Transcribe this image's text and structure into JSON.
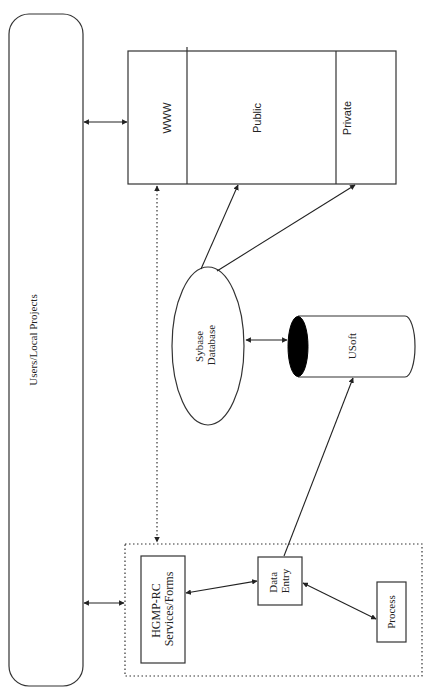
{
  "diagram": {
    "nodes": {
      "users": {
        "label": "Users/Local Projects",
        "shape": "rounded-rect"
      },
      "web_server": {
        "shape": "rect",
        "sections": [
          {
            "id": "www",
            "label": "WWW"
          },
          {
            "id": "public",
            "label": "Public"
          },
          {
            "id": "private",
            "label": "Private"
          }
        ]
      },
      "sybase": {
        "label_line1": "Sybase",
        "label_line2": "Database",
        "shape": "ellipse"
      },
      "usoft": {
        "label": "USoft",
        "shape": "cylinder"
      },
      "hgmp_group": {
        "shape": "dotted-rect"
      },
      "hgmp": {
        "label_line1": "HGMP-RC",
        "label_line2": "Services/Forms",
        "shape": "rect"
      },
      "data_entry": {
        "label_line1": "Data",
        "label_line2": "Entry",
        "shape": "rect"
      },
      "process": {
        "label": "Process",
        "shape": "rect"
      }
    },
    "edges": [
      {
        "from": "users",
        "to": "web_server.www",
        "style": "solid",
        "arrows": "both"
      },
      {
        "from": "users",
        "to": "hgmp_group",
        "style": "solid",
        "arrows": "both"
      },
      {
        "from": "hgmp_group",
        "to": "web_server.www",
        "style": "dotted",
        "arrows": "both"
      },
      {
        "from": "sybase",
        "to": "web_server.public",
        "style": "solid",
        "arrows": "end"
      },
      {
        "from": "sybase",
        "to": "web_server.private",
        "style": "solid",
        "arrows": "end"
      },
      {
        "from": "sybase",
        "to": "usoft",
        "style": "solid",
        "arrows": "both"
      },
      {
        "from": "hgmp",
        "to": "data_entry",
        "style": "solid",
        "arrows": "both"
      },
      {
        "from": "data_entry",
        "to": "process",
        "style": "solid",
        "arrows": "both"
      },
      {
        "from": "data_entry",
        "to": "usoft",
        "style": "solid",
        "arrows": "end"
      }
    ],
    "colors": {
      "stroke": "#333333",
      "fill": "#ffffff",
      "usoft_cap": "#000000",
      "text": "#222222"
    }
  }
}
